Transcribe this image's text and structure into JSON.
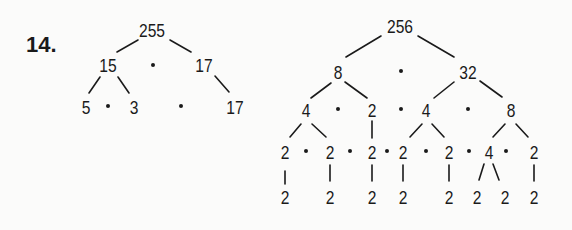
{
  "problem": {
    "label": "14."
  },
  "tree_left": {
    "root": "255",
    "level1": [
      "15",
      "17"
    ],
    "level2": [
      "5",
      "3",
      "17"
    ],
    "dot_symbol": "·"
  },
  "tree_right": {
    "root": "256",
    "level1": [
      "8",
      "32"
    ],
    "level2": [
      "4",
      "2",
      "4",
      "8"
    ],
    "level3": [
      "2",
      "2",
      "2",
      "2",
      "2",
      "4",
      "2"
    ],
    "level4": [
      "2",
      "2",
      "2",
      "2",
      "2",
      "2",
      "2",
      "2"
    ],
    "dot_symbol": "·"
  }
}
